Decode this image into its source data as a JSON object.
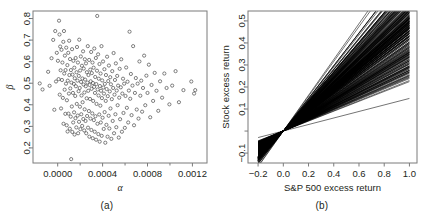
{
  "figure": {
    "panel_a_caption": "(a)",
    "panel_b_caption": "(b)"
  },
  "chart_data": [
    {
      "id": "panel-a",
      "type": "scatter",
      "title": "",
      "caption": "(a)",
      "xlabel": "α",
      "ylabel": "β",
      "xlim": [
        -0.00022,
        0.00133
      ],
      "ylim": [
        0.13,
        0.835
      ],
      "xticks": [
        0.0,
        0.0004,
        0.0008,
        0.0012
      ],
      "xticklabels": [
        "0.0000",
        "0.0004",
        "0.0008",
        "0.0012"
      ],
      "xminorticks": [
        0.0002,
        0.0006,
        0.001
      ],
      "yticks": [
        0.2,
        0.3,
        0.4,
        0.5,
        0.6,
        0.7,
        0.8
      ],
      "yticklabels": [
        "0.2",
        "0.3",
        "0.4",
        "0.5",
        "0.6",
        "0.7",
        "0.8"
      ],
      "grid": false,
      "legend": "none",
      "marker": "open-circle",
      "marker_color": "#4a4a4a",
      "n_points": 252,
      "points": [
        [
          -0.00016,
          0.499
        ],
        [
          -0.000135,
          0.471
        ],
        [
          -8.5e-05,
          0.553
        ],
        [
          -7.2e-05,
          0.488
        ],
        [
          -5.5e-05,
          0.616
        ],
        [
          -4e-05,
          0.701
        ],
        [
          -3e-05,
          0.377
        ],
        [
          -2.2e-05,
          0.742
        ],
        [
          -1.5e-05,
          0.508
        ],
        [
          -8e-06,
          0.641
        ],
        [
          2e-06,
          0.604
        ],
        [
          8e-06,
          0.519
        ],
        [
          1.2e-05,
          0.79
        ],
        [
          1.6e-05,
          0.726
        ],
        [
          1.8e-05,
          0.447
        ],
        [
          2.2e-05,
          0.67
        ],
        [
          2.6e-05,
          0.56
        ],
        [
          3e-05,
          0.383
        ],
        [
          3.4e-05,
          0.655
        ],
        [
          3.8e-05,
          0.515
        ],
        [
          4.2e-05,
          0.596
        ],
        [
          4.6e-05,
          0.432
        ],
        [
          5e-05,
          0.692
        ],
        [
          5.2e-05,
          0.312
        ],
        [
          5.6e-05,
          0.742
        ],
        [
          5.8e-05,
          0.545
        ],
        [
          6.2e-05,
          0.47
        ],
        [
          6.4e-05,
          0.628
        ],
        [
          6.8e-05,
          0.358
        ],
        [
          7e-05,
          0.561
        ],
        [
          7.4e-05,
          0.498
        ],
        [
          7.6e-05,
          0.665
        ],
        [
          8e-05,
          0.305
        ],
        [
          8.2e-05,
          0.421
        ],
        [
          8.6e-05,
          0.584
        ],
        [
          8.8e-05,
          0.276
        ],
        [
          9e-05,
          0.512
        ],
        [
          9.4e-05,
          0.641
        ],
        [
          9.6e-05,
          0.359
        ],
        [
          0.0001,
          0.452
        ],
        [
          0.000102,
          0.697
        ],
        [
          0.000104,
          0.538
        ],
        [
          0.000108,
          0.289
        ],
        [
          0.00011,
          0.612
        ],
        [
          0.000112,
          0.476
        ],
        [
          0.000116,
          0.345
        ],
        [
          0.000118,
          0.561
        ],
        [
          0.00012,
          0.148
        ],
        [
          0.000122,
          0.503
        ],
        [
          0.000126,
          0.392
        ],
        [
          0.000128,
          0.658
        ],
        [
          0.00013,
          0.274
        ],
        [
          0.000132,
          0.54
        ],
        [
          0.000136,
          0.455
        ],
        [
          0.000138,
          0.318
        ],
        [
          0.00014,
          0.604
        ],
        [
          0.000144,
          0.497
        ],
        [
          0.000146,
          0.365
        ],
        [
          0.000148,
          0.572
        ],
        [
          0.00015,
          0.262
        ],
        [
          0.000152,
          0.523
        ],
        [
          0.000156,
          0.441
        ],
        [
          0.000158,
          0.338
        ],
        [
          0.00016,
          0.617
        ],
        [
          0.000162,
          0.486
        ],
        [
          0.000166,
          0.295
        ],
        [
          0.000168,
          0.551
        ],
        [
          0.00017,
          0.404
        ],
        [
          0.000172,
          0.668
        ],
        [
          0.000176,
          0.512
        ],
        [
          0.000178,
          0.35
        ],
        [
          0.00018,
          0.596
        ],
        [
          0.000182,
          0.268
        ],
        [
          0.000186,
          0.463
        ],
        [
          0.000188,
          0.534
        ],
        [
          0.00019,
          0.321
        ],
        [
          0.000192,
          0.702
        ],
        [
          0.000196,
          0.478
        ],
        [
          0.000198,
          0.391
        ],
        [
          0.0002,
          0.559
        ],
        [
          0.000202,
          0.287
        ],
        [
          0.000206,
          0.624
        ],
        [
          0.000208,
          0.506
        ],
        [
          0.00021,
          0.356
        ],
        [
          0.000212,
          0.443
        ],
        [
          0.000216,
          0.581
        ],
        [
          0.000218,
          0.302
        ],
        [
          0.00022,
          0.522
        ],
        [
          0.000222,
          0.412
        ],
        [
          0.000226,
          0.648
        ],
        [
          0.000228,
          0.334
        ],
        [
          0.00023,
          0.494
        ],
        [
          0.000232,
          0.568
        ],
        [
          0.000236,
          0.281
        ],
        [
          0.000238,
          0.457
        ],
        [
          0.00024,
          0.379
        ],
        [
          0.000242,
          0.611
        ],
        [
          0.000244,
          0.517
        ],
        [
          0.000248,
          0.325
        ],
        [
          0.00025,
          0.486
        ],
        [
          0.000252,
          0.592
        ],
        [
          0.000254,
          0.268
        ],
        [
          0.000258,
          0.43
        ],
        [
          0.00026,
          0.551
        ],
        [
          0.000262,
          0.348
        ],
        [
          0.000264,
          0.503
        ],
        [
          0.000268,
          0.672
        ],
        [
          0.00027,
          0.294
        ],
        [
          0.000272,
          0.465
        ],
        [
          0.000274,
          0.538
        ],
        [
          0.000278,
          0.371
        ],
        [
          0.00028,
          0.608
        ],
        [
          0.000282,
          0.252
        ],
        [
          0.000284,
          0.492
        ],
        [
          0.000288,
          0.427
        ],
        [
          0.00029,
          0.563
        ],
        [
          0.000292,
          0.336
        ],
        [
          0.000294,
          0.509
        ],
        [
          0.000298,
          0.645
        ],
        [
          0.0003,
          0.283
        ],
        [
          0.000302,
          0.474
        ],
        [
          0.000304,
          0.547
        ],
        [
          0.000308,
          0.36
        ],
        [
          0.00031,
          0.596
        ],
        [
          0.000312,
          0.245
        ],
        [
          0.000314,
          0.501
        ],
        [
          0.000316,
          0.418
        ],
        [
          0.00032,
          0.572
        ],
        [
          0.000322,
          0.329
        ],
        [
          0.000324,
          0.483
        ],
        [
          0.000326,
          0.661
        ],
        [
          0.00033,
          0.275
        ],
        [
          0.000332,
          0.455
        ],
        [
          0.000334,
          0.529
        ],
        [
          0.000336,
          0.347
        ],
        [
          0.00034,
          0.617
        ],
        [
          0.000342,
          0.238
        ],
        [
          0.000344,
          0.496
        ],
        [
          0.000346,
          0.404
        ],
        [
          0.00035,
          0.558
        ],
        [
          0.000352,
          0.812
        ],
        [
          0.000354,
          0.312
        ],
        [
          0.000356,
          0.471
        ],
        [
          0.00036,
          0.634
        ],
        [
          0.000362,
          0.264
        ],
        [
          0.000364,
          0.443
        ],
        [
          0.000366,
          0.521
        ],
        [
          0.00037,
          0.355
        ],
        [
          0.000372,
          0.589
        ],
        [
          0.000374,
          0.229
        ],
        [
          0.000376,
          0.487
        ],
        [
          0.00038,
          0.396
        ],
        [
          0.000382,
          0.545
        ],
        [
          0.000384,
          0.318
        ],
        [
          0.000386,
          0.465
        ],
        [
          0.00039,
          0.672
        ],
        [
          0.000392,
          0.256
        ],
        [
          0.000394,
          0.431
        ],
        [
          0.000396,
          0.513
        ],
        [
          0.0004,
          0.34
        ],
        [
          0.000404,
          0.601
        ],
        [
          0.000406,
          0.48
        ],
        [
          0.00041,
          0.288
        ],
        [
          0.000412,
          0.452
        ],
        [
          0.000416,
          0.565
        ],
        [
          0.000418,
          0.366
        ],
        [
          0.00042,
          0.497
        ],
        [
          0.000424,
          0.224
        ],
        [
          0.000428,
          0.418
        ],
        [
          0.00043,
          0.538
        ],
        [
          0.000434,
          0.307
        ],
        [
          0.000436,
          0.473
        ],
        [
          0.00044,
          0.623
        ],
        [
          0.000444,
          0.252
        ],
        [
          0.000446,
          0.44
        ],
        [
          0.00045,
          0.51
        ],
        [
          0.000454,
          0.349
        ],
        [
          0.000456,
          0.582
        ],
        [
          0.00046,
          0.29
        ],
        [
          0.000464,
          0.462
        ],
        [
          0.000468,
          0.528
        ],
        [
          0.00047,
          0.383
        ],
        [
          0.000474,
          0.495
        ],
        [
          0.000478,
          0.242
        ],
        [
          0.000482,
          0.426
        ],
        [
          0.000486,
          0.556
        ],
        [
          0.00049,
          0.325
        ],
        [
          0.000494,
          0.478
        ],
        [
          0.000498,
          0.64
        ],
        [
          0.000502,
          0.268
        ],
        [
          0.000506,
          0.447
        ],
        [
          0.00051,
          0.515
        ],
        [
          0.000514,
          0.356
        ],
        [
          0.000518,
          0.592
        ],
        [
          0.000522,
          0.296
        ],
        [
          0.000526,
          0.466
        ],
        [
          0.00053,
          0.534
        ],
        [
          0.000534,
          0.398
        ],
        [
          0.000538,
          0.489
        ],
        [
          0.000544,
          0.248
        ],
        [
          0.000548,
          0.433
        ],
        [
          0.000552,
          0.567
        ],
        [
          0.000556,
          0.333
        ],
        [
          0.000562,
          0.481
        ],
        [
          0.000566,
          0.611
        ],
        [
          0.000572,
          0.275
        ],
        [
          0.000576,
          0.452
        ],
        [
          0.000582,
          0.521
        ],
        [
          0.000586,
          0.362
        ],
        [
          0.000592,
          0.498
        ],
        [
          0.000598,
          0.293
        ],
        [
          0.000604,
          0.441
        ],
        [
          0.00061,
          0.573
        ],
        [
          0.000616,
          0.386
        ],
        [
          0.000622,
          0.507
        ],
        [
          0.000628,
          0.318
        ],
        [
          0.000634,
          0.466
        ],
        [
          0.00064,
          0.739
        ],
        [
          0.000646,
          0.428
        ],
        [
          0.000652,
          0.543
        ],
        [
          0.000658,
          0.352
        ],
        [
          0.000666,
          0.489
        ],
        [
          0.000672,
          0.672
        ],
        [
          0.00068,
          0.305
        ],
        [
          0.000688,
          0.455
        ],
        [
          0.000696,
          0.524
        ],
        [
          0.000704,
          0.378
        ],
        [
          0.000712,
          0.498
        ],
        [
          0.00072,
          0.336
        ],
        [
          0.000728,
          0.601
        ],
        [
          0.000736,
          0.442
        ],
        [
          0.000744,
          0.512
        ],
        [
          0.000752,
          0.368
        ],
        [
          0.00076,
          0.478
        ],
        [
          0.00077,
          0.628
        ],
        [
          0.00078,
          0.398
        ],
        [
          0.00079,
          0.535
        ],
        [
          0.0008,
          0.455
        ],
        [
          0.000812,
          0.586
        ],
        [
          0.000824,
          0.342
        ],
        [
          0.000836,
          0.492
        ],
        [
          0.00085,
          0.418
        ],
        [
          0.000864,
          0.548
        ],
        [
          0.00088,
          0.465
        ],
        [
          0.000896,
          0.372
        ],
        [
          0.000912,
          0.509
        ],
        [
          0.00093,
          0.433
        ],
        [
          0.00095,
          0.545
        ],
        [
          0.00097,
          0.478
        ],
        [
          0.000995,
          0.402
        ],
        [
          0.00102,
          0.489
        ],
        [
          0.00105,
          0.556
        ],
        [
          0.00108,
          0.412
        ],
        [
          0.00112,
          0.468
        ],
        [
          0.00119,
          0.508
        ],
        [
          0.001215,
          0.452
        ],
        [
          0.001225,
          0.468
        ]
      ]
    },
    {
      "id": "panel-b",
      "type": "line",
      "title": "",
      "caption": "(b)",
      "xlabel": "S&P 500 excess return",
      "ylabel": "Stock excess return",
      "xlim": [
        -0.28,
        1.06
      ],
      "ylim": [
        -0.145,
        0.545
      ],
      "xticks": [
        -0.2,
        0.0,
        0.2,
        0.4,
        0.6,
        0.8,
        1.0
      ],
      "xticklabels": [
        "−0.2",
        "0.0",
        "0.2",
        "0.4",
        "0.6",
        "0.8",
        "1.0"
      ],
      "yticks": [
        -0.1,
        0.0,
        0.1,
        0.2,
        0.3,
        0.4,
        0.5
      ],
      "yticklabels": [
        "−0.1",
        "",
        "0.1",
        "0.2",
        "0.3",
        "0.4",
        "0.5"
      ],
      "grid": false,
      "legend": "none",
      "description": "Fan of 252 fitted CAPM security characteristic lines y = alpha + beta*x, all nearly passing through the origin; slopes (beta) range about 0.15 to 0.81 and intercepts (alpha) range about -0.0002 to 0.0013.",
      "line_color": "#000000",
      "n_lines": 252,
      "slope_range": [
        0.148,
        0.812
      ],
      "intercept_range": [
        -0.00016,
        0.001225
      ]
    }
  ]
}
